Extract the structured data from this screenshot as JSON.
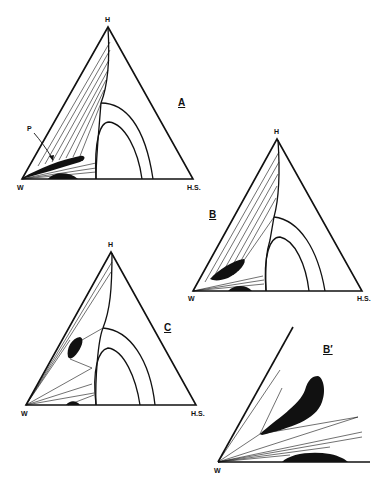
{
  "figure": {
    "panels": [
      {
        "id": "A",
        "label": "A",
        "vertices": {
          "top": "H",
          "left": "W",
          "right": "H.S."
        },
        "annotation": "P"
      },
      {
        "id": "B",
        "label": "B",
        "vertices": {
          "top": "H",
          "left": "W",
          "right": "H.S."
        }
      },
      {
        "id": "C",
        "label": "C",
        "vertices": {
          "top": "H",
          "left": "W",
          "right": "H.S."
        }
      },
      {
        "id": "Bprime",
        "label": "B′",
        "vertices": {
          "origin": "W"
        }
      }
    ]
  },
  "colors": {
    "ink": "#111111",
    "background": "#ffffff"
  }
}
